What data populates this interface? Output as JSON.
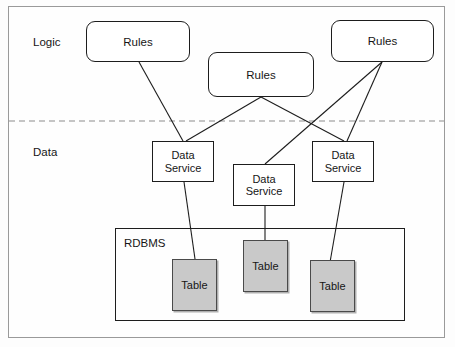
{
  "diagram": {
    "type": "layered-architecture",
    "frame": {
      "stroke": "#9a9a9a"
    },
    "divider": {
      "name": "logic-data-divider",
      "style": "dashed",
      "color": "#8c8c8c",
      "y": 121
    },
    "tier_labels": [
      {
        "name": "logic",
        "text": "Logic",
        "x": 33,
        "y": 36
      },
      {
        "name": "data",
        "text": "Data",
        "x": 33,
        "y": 146
      }
    ],
    "rules_nodes": [
      {
        "id": "rules-1",
        "text": "Rules",
        "x": 86,
        "y": 21,
        "w": 104,
        "h": 41
      },
      {
        "id": "rules-2",
        "text": "Rules",
        "x": 208,
        "y": 52,
        "w": 106,
        "h": 45
      },
      {
        "id": "rules-3",
        "text": "Rules",
        "x": 331,
        "y": 20,
        "w": 103,
        "h": 42
      }
    ],
    "data_service_nodes": [
      {
        "id": "ds-1",
        "line1": "Data",
        "line2": "Service",
        "x": 152,
        "y": 141,
        "w": 62,
        "h": 41
      },
      {
        "id": "ds-2",
        "line1": "Data",
        "line2": "Service",
        "x": 233,
        "y": 164,
        "w": 62,
        "h": 42
      },
      {
        "id": "ds-3",
        "line1": "Data",
        "line2": "Service",
        "x": 312,
        "y": 141,
        "w": 62,
        "h": 41
      }
    ],
    "rdbms": {
      "label": "RDBMS",
      "label_x": 124,
      "label_y": 237,
      "x": 115,
      "y": 228,
      "w": 290,
      "h": 93,
      "fill": "none"
    },
    "table_nodes": [
      {
        "id": "table-1",
        "text": "Table",
        "x": 172,
        "y": 259,
        "w": 45,
        "h": 52,
        "fill": "#c9c9c9"
      },
      {
        "id": "table-2",
        "text": "Table",
        "x": 243,
        "y": 240,
        "w": 45,
        "h": 52,
        "fill": "#c9c9c9"
      },
      {
        "id": "table-3",
        "text": "Table",
        "x": 310,
        "y": 260,
        "w": 45,
        "h": 52,
        "fill": "#c9c9c9"
      }
    ],
    "connectors": [
      {
        "name": "connector-rules1-ds1",
        "from": "rules-1",
        "to": "ds-1",
        "x1": 139,
        "y1": 62,
        "x2": 183,
        "y2": 141
      },
      {
        "name": "connector-rules2-ds1",
        "from": "rules-2",
        "to": "ds-1",
        "x1": 261,
        "y1": 97,
        "x2": 186,
        "y2": 141
      },
      {
        "name": "connector-rules2-ds3",
        "from": "rules-2",
        "to": "ds-3",
        "x1": 261,
        "y1": 97,
        "x2": 344,
        "y2": 141
      },
      {
        "name": "connector-rules3-ds2",
        "from": "rules-3",
        "to": "ds-2",
        "x1": 382,
        "y1": 62,
        "x2": 265,
        "y2": 164
      },
      {
        "name": "connector-rules3-ds3",
        "from": "rules-3",
        "to": "ds-3",
        "x1": 382,
        "y1": 62,
        "x2": 347,
        "y2": 141
      },
      {
        "name": "connector-ds1-table1",
        "from": "ds-1",
        "to": "table-1",
        "x1": 184,
        "y1": 182,
        "x2": 196,
        "y2": 266
      },
      {
        "name": "connector-ds2-table2",
        "from": "ds-2",
        "to": "table-2",
        "x1": 265,
        "y1": 206,
        "x2": 265,
        "y2": 240
      },
      {
        "name": "connector-ds3-table3",
        "from": "ds-3",
        "to": "table-3",
        "x1": 344,
        "y1": 182,
        "x2": 329,
        "y2": 268
      }
    ]
  }
}
